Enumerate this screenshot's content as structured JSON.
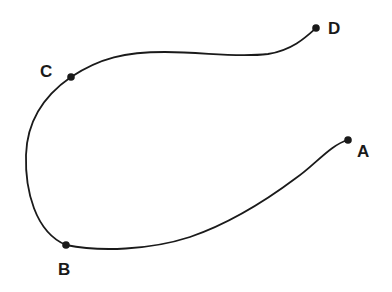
{
  "diagram": {
    "type": "curve-through-points",
    "stroke_color": "#1a1a1a",
    "background": "#ffffff",
    "points": [
      {
        "id": "A",
        "label": "A",
        "x": 348,
        "y": 140,
        "label_x": 357,
        "label_y": 157
      },
      {
        "id": "B",
        "label": "B",
        "x": 66,
        "y": 245,
        "label_x": 58,
        "label_y": 275
      },
      {
        "id": "C",
        "label": "C",
        "x": 71,
        "y": 77,
        "label_x": 40,
        "label_y": 77
      },
      {
        "id": "D",
        "label": "D",
        "x": 316,
        "y": 28,
        "label_x": 328,
        "label_y": 34
      }
    ]
  }
}
